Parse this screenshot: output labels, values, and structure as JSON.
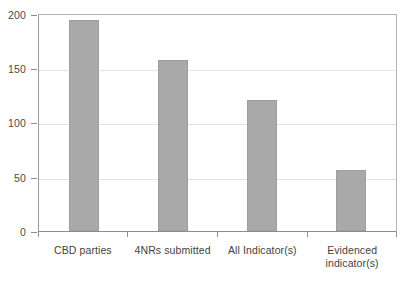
{
  "chart_data": {
    "type": "bar",
    "title": "",
    "subtitle": "",
    "xlabel": "",
    "ylabel": "",
    "categories": [
      "CBD parties",
      "4NRs submitted",
      "All Indicator(s)",
      "Evidenced indicator(s)"
    ],
    "values": [
      194,
      157,
      120,
      56
    ],
    "ylim": [
      0,
      200
    ],
    "yticks": [
      0,
      50,
      100,
      150,
      200
    ],
    "ytick_labels": [
      "0",
      "50",
      "100",
      "150",
      "200"
    ],
    "grid": true,
    "grid_axis": "y",
    "legend": null,
    "legend_position": "none",
    "bar_color": "#a9a9a9",
    "bar_edge_color": "#9e9e9e",
    "background_color": "#ffffff",
    "gridline_color": "#e2e2e2",
    "axis_color": "#8d8d8d",
    "annotations": []
  },
  "category_label_lines": [
    [
      "CBD parties"
    ],
    [
      "4NRs submitted"
    ],
    [
      "All Indicator(s)"
    ],
    [
      "Evidenced",
      "indicator(s)"
    ]
  ]
}
